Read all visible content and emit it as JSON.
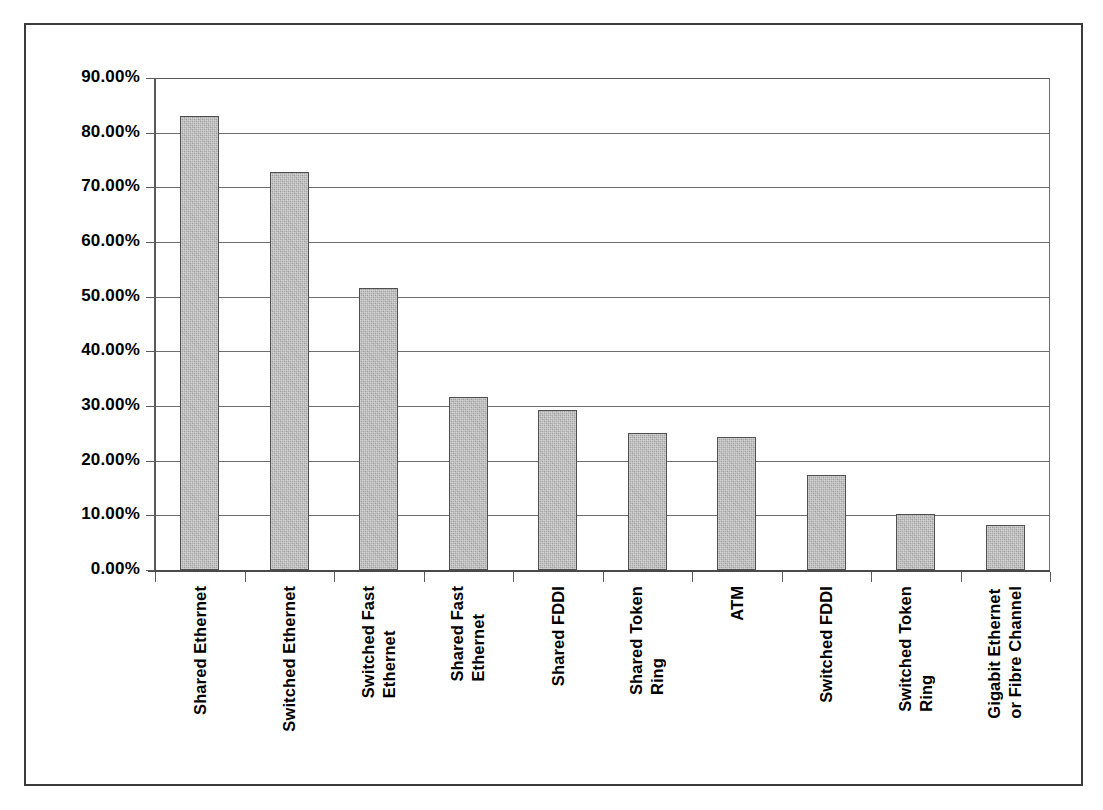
{
  "chart_data": {
    "type": "bar",
    "title": "",
    "subtitle": "",
    "xlabel": "",
    "ylabel": "",
    "ylim": [
      0,
      90
    ],
    "grid": true,
    "legend": false,
    "legend_position": "none",
    "y_tick_labels": [
      "0.00%",
      "10.00%",
      "20.00%",
      "30.00%",
      "40.00%",
      "50.00%",
      "60.00%",
      "70.00%",
      "80.00%",
      "90.00%"
    ],
    "y_tick_values": [
      0,
      10,
      20,
      30,
      40,
      50,
      60,
      70,
      80,
      90
    ],
    "categories": [
      "Shared Ethernet",
      "Switched Ethernet",
      "Switched Fast Ethernet",
      "Shared Fast Ethernet",
      "Shared FDDI",
      "Shared Token Ring",
      "ATM",
      "Switched FDDI",
      "Switched Token Ring",
      "Gigabit Ethernet or Fibre Channel"
    ],
    "category_lines": [
      [
        "Shared Ethernet"
      ],
      [
        "Switched Ethernet"
      ],
      [
        "Switched Fast",
        "Ethernet"
      ],
      [
        "Shared Fast",
        "Ethernet"
      ],
      [
        "Shared FDDI"
      ],
      [
        "Shared Token",
        "Ring"
      ],
      [
        "ATM"
      ],
      [
        "Switched FDDI"
      ],
      [
        "Switched Token",
        "Ring"
      ],
      [
        "Gigabit Ethernet",
        "or Fibre Channel"
      ]
    ],
    "values": [
      83.0,
      72.8,
      51.5,
      31.6,
      29.3,
      25.0,
      24.4,
      17.4,
      10.2,
      8.3
    ],
    "value_labels": [
      "83.00%",
      "72.80%",
      "51.50%",
      "31.60%",
      "29.30%",
      "25.00%",
      "24.40%",
      "17.40%",
      "10.20%",
      "8.30%"
    ],
    "bar_color": "#ababab",
    "bar_edge_color": "#4f4f4f",
    "grid_color": "#6e6e6e",
    "axis_color": "#5a5a5a",
    "frame_color": "#3b3b3b",
    "text_color": "#000000"
  }
}
